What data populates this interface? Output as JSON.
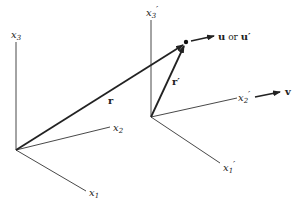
{
  "diagram": {
    "frame_unprimed": {
      "axes": {
        "x1": {
          "base": "x",
          "sub": "1",
          "prime": ""
        },
        "x2": {
          "base": "x",
          "sub": "2",
          "prime": ""
        },
        "x3": {
          "base": "x",
          "sub": "3",
          "prime": ""
        }
      },
      "position_vector": "r"
    },
    "frame_primed": {
      "axes": {
        "x1": {
          "base": "x",
          "sub": "1",
          "prime": "′"
        },
        "x2": {
          "base": "x",
          "sub": "2",
          "prime": "′"
        },
        "x3": {
          "base": "x",
          "sub": "3",
          "prime": "′"
        }
      },
      "position_vector": "r′"
    },
    "velocity_label": {
      "u": "u",
      "or": " or ",
      "u_prime": "u′"
    },
    "frame_velocity": "v",
    "colors": {
      "line": "#222222",
      "background": "#ffffff"
    }
  }
}
